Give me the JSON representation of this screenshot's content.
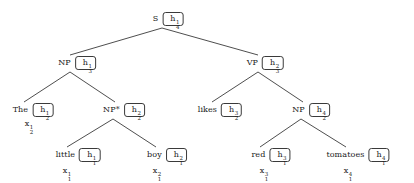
{
  "diagram": {
    "sentence": "The little boy likes red tomatoes",
    "edge_color": "#3a3a3a",
    "text_color": "#1a1a1a",
    "box_border_color": "#3a3a3a",
    "background": "#ffffff"
  },
  "nodes": [
    {
      "id": "s",
      "label": "S",
      "h": {
        "base": "h",
        "sup": "1",
        "sub": "4"
      },
      "x": 168,
      "y": 19
    },
    {
      "id": "np-subject",
      "label": "NP",
      "h": {
        "base": "h",
        "sup": "1",
        "sub": "3"
      },
      "x": 77,
      "y": 63
    },
    {
      "id": "vp",
      "label": "VP",
      "h": {
        "base": "h",
        "sup": "2",
        "sub": "3"
      },
      "x": 265,
      "y": 63
    },
    {
      "id": "the",
      "label": "The",
      "h": {
        "base": "h",
        "sup": "1",
        "sub": "2"
      },
      "x": 33,
      "y": 110
    },
    {
      "id": "np-star",
      "label": "NP*",
      "h": {
        "base": "h",
        "sup": "2",
        "sub": "2"
      },
      "x": 124,
      "y": 110
    },
    {
      "id": "likes",
      "label": "likes",
      "h": {
        "base": "h",
        "sup": "3",
        "sub": "2"
      },
      "x": 220,
      "y": 110
    },
    {
      "id": "np-object",
      "label": "NP",
      "h": {
        "base": "h",
        "sup": "4",
        "sub": "2"
      },
      "x": 311,
      "y": 110
    },
    {
      "id": "little",
      "label": "little",
      "h": {
        "base": "h",
        "sup": "1",
        "sub": "1"
      },
      "x": 78,
      "y": 155
    },
    {
      "id": "boy",
      "label": "boy",
      "h": {
        "base": "h",
        "sup": "2",
        "sub": "1"
      },
      "x": 167,
      "y": 155
    },
    {
      "id": "red",
      "label": "red",
      "h": {
        "base": "h",
        "sup": "3",
        "sub": "1"
      },
      "x": 271,
      "y": 155
    },
    {
      "id": "tomatoes",
      "label": "tomatoes",
      "h": {
        "base": "h",
        "sup": "4",
        "sub": "1"
      },
      "x": 358,
      "y": 155
    }
  ],
  "inputs": [
    {
      "id": "x-the",
      "base": "x",
      "sup": "1",
      "sub": "2",
      "x": 27,
      "y": 124
    },
    {
      "id": "x-little",
      "base": "x",
      "sup": "1",
      "sub": "1",
      "x": 65,
      "y": 171
    },
    {
      "id": "x-boy",
      "base": "x",
      "sup": "2",
      "sub": "1",
      "x": 155,
      "y": 171
    },
    {
      "id": "x-red",
      "base": "x",
      "sup": "3",
      "sub": "1",
      "x": 262,
      "y": 171
    },
    {
      "id": "x-tomatoes",
      "base": "x",
      "sup": "4",
      "sub": "1",
      "x": 346,
      "y": 171
    }
  ],
  "edges": [
    {
      "id": "s-np",
      "from": "s",
      "to": "np-subject",
      "x1": 162,
      "y1": 28,
      "x2": 70,
      "y2": 55
    },
    {
      "id": "s-vp",
      "from": "s",
      "to": "vp",
      "x1": 162,
      "y1": 28,
      "x2": 258,
      "y2": 55
    },
    {
      "id": "np-the",
      "from": "np-subject",
      "to": "the",
      "x1": 70,
      "y1": 72,
      "x2": 24,
      "y2": 102
    },
    {
      "id": "np-npstar",
      "from": "np-subject",
      "to": "np-star",
      "x1": 70,
      "y1": 72,
      "x2": 115,
      "y2": 102
    },
    {
      "id": "vp-likes",
      "from": "vp",
      "to": "likes",
      "x1": 258,
      "y1": 72,
      "x2": 212,
      "y2": 102
    },
    {
      "id": "vp-np",
      "from": "vp",
      "to": "np-object",
      "x1": 258,
      "y1": 72,
      "x2": 303,
      "y2": 102
    },
    {
      "id": "npstar-little",
      "from": "np-star",
      "to": "little",
      "x1": 113,
      "y1": 119,
      "x2": 67,
      "y2": 147
    },
    {
      "id": "npstar-boy",
      "from": "np-star",
      "to": "boy",
      "x1": 113,
      "y1": 119,
      "x2": 156,
      "y2": 147
    },
    {
      "id": "npobj-red",
      "from": "np-object",
      "to": "red",
      "x1": 301,
      "y1": 119,
      "x2": 260,
      "y2": 147
    },
    {
      "id": "npobj-tomatoes",
      "from": "np-object",
      "to": "tomatoes",
      "x1": 301,
      "y1": 119,
      "x2": 346,
      "y2": 147
    }
  ]
}
